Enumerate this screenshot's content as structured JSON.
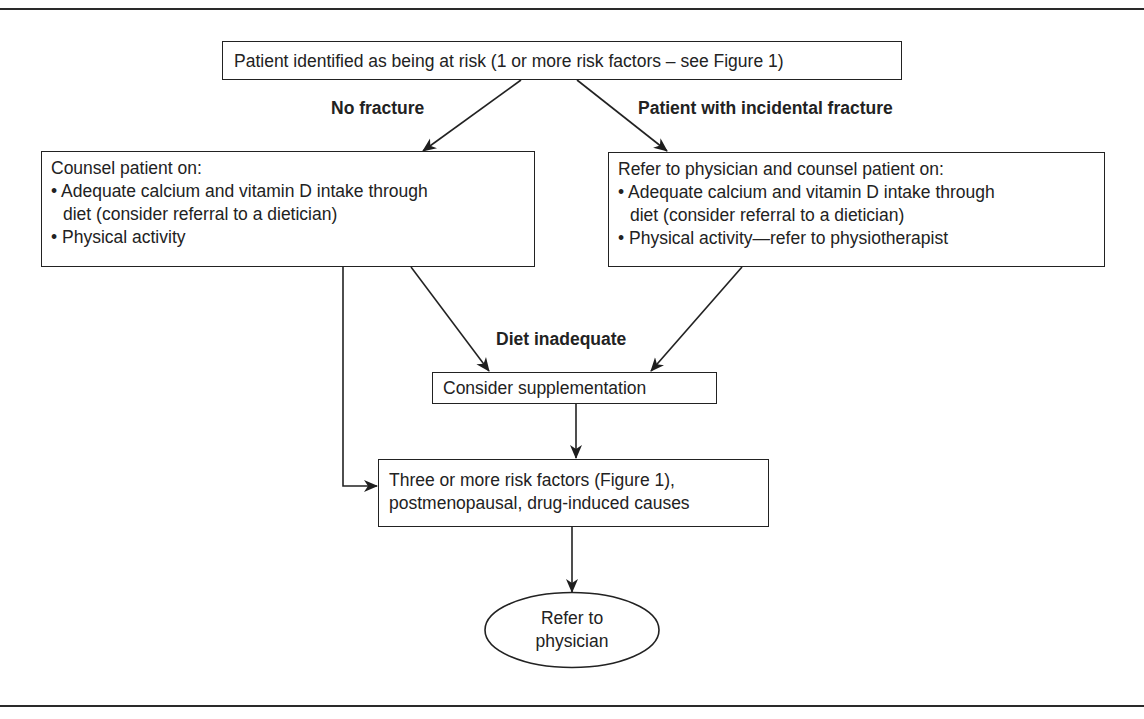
{
  "diagram": {
    "type": "flowchart",
    "nodes": {
      "start": {
        "text": "Patient identified as being at risk (1 or more risk factors – see Figure 1)"
      },
      "counsel": {
        "title": "Counsel patient on:",
        "bullets": [
          {
            "line1": "• Adequate calcium and vitamin D intake through",
            "line2": "diet (consider referral to a dietician)"
          },
          {
            "line1": "• Physical activity"
          }
        ]
      },
      "refer_counsel": {
        "title": "Refer to physician and counsel patient on:",
        "bullets": [
          {
            "line1": "• Adequate calcium and vitamin D intake through",
            "line2": "diet (consider referral to a dietician)"
          },
          {
            "line1": "• Physical activity—refer to physiotherapist"
          }
        ]
      },
      "supplementation": {
        "text": "Consider supplementation"
      },
      "risk_factors": {
        "line1": "Three or more risk factors (Figure 1),",
        "line2": "postmenopausal, drug-induced causes"
      },
      "refer_physician": {
        "line1": "Refer to",
        "line2": "physician"
      }
    },
    "edge_labels": {
      "no_fracture": "No fracture",
      "incidental_fracture": "Patient with incidental fracture",
      "diet_inadequate": "Diet inadequate"
    },
    "edges": [
      {
        "from": "start",
        "to": "counsel",
        "label": "No fracture"
      },
      {
        "from": "start",
        "to": "refer_counsel",
        "label": "Patient with incidental fracture"
      },
      {
        "from": "counsel",
        "to": "supplementation",
        "label": "Diet inadequate"
      },
      {
        "from": "refer_counsel",
        "to": "supplementation",
        "label": "Diet inadequate"
      },
      {
        "from": "counsel",
        "to": "risk_factors"
      },
      {
        "from": "supplementation",
        "to": "risk_factors"
      },
      {
        "from": "risk_factors",
        "to": "refer_physician"
      }
    ],
    "colors": {
      "stroke": "#222222",
      "text": "#222222",
      "background": "#ffffff"
    }
  }
}
